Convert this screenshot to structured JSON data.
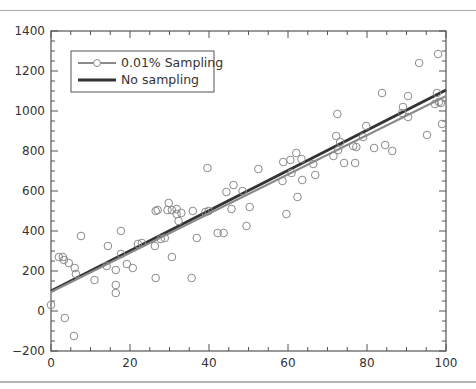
{
  "chart_data": {
    "type": "scatter",
    "title": "",
    "xlabel": "",
    "ylabel": "",
    "xlim": [
      0,
      100
    ],
    "ylim": [
      -200,
      1400
    ],
    "x_ticks": [
      0,
      20,
      40,
      60,
      80,
      100
    ],
    "y_ticks": [
      -200,
      0,
      200,
      400,
      600,
      800,
      1000,
      1200,
      1400
    ],
    "x_tick_labels": [
      "0",
      "20",
      "40",
      "60",
      "80",
      "100"
    ],
    "y_tick_labels": [
      "−200",
      "0",
      "200",
      "400",
      "600",
      "800",
      "1000",
      "1200",
      "1400"
    ],
    "grid": false,
    "legend_position": "upper left",
    "series": [
      {
        "name": "0.01% Sampling",
        "kind": "scatter+fit",
        "color": "#8a8a8a",
        "marker": "open-circle",
        "fit_line": {
          "x": [
            0,
            100
          ],
          "y": [
            95,
            1075
          ]
        },
        "points": [
          [
            0,
            30
          ],
          [
            2,
            270
          ],
          [
            3,
            270
          ],
          [
            3.3,
            255
          ],
          [
            4.5,
            240
          ],
          [
            6,
            215
          ],
          [
            6.3,
            185
          ],
          [
            3.5,
            -35
          ],
          [
            5.8,
            -125
          ],
          [
            7.6,
            375
          ],
          [
            11,
            155
          ],
          [
            14.4,
            325
          ],
          [
            14.1,
            225
          ],
          [
            16.4,
            205
          ],
          [
            16.4,
            130
          ],
          [
            16.4,
            90
          ],
          [
            17.7,
            400
          ],
          [
            17.7,
            285
          ],
          [
            19.2,
            235
          ],
          [
            20.7,
            215
          ],
          [
            22,
            335
          ],
          [
            23,
            340
          ],
          [
            26.3,
            325
          ],
          [
            26.5,
            165
          ],
          [
            26.5,
            500
          ],
          [
            27,
            505
          ],
          [
            27.8,
            360
          ],
          [
            28.8,
            365
          ],
          [
            29.5,
            505
          ],
          [
            29.8,
            540
          ],
          [
            30.6,
            505
          ],
          [
            30.6,
            270
          ],
          [
            31.8,
            510
          ],
          [
            31.8,
            485
          ],
          [
            32.3,
            450
          ],
          [
            33,
            490
          ],
          [
            35.6,
            165
          ],
          [
            35.9,
            500
          ],
          [
            36.9,
            365
          ],
          [
            39.1,
            495
          ],
          [
            39.9,
            500
          ],
          [
            39.6,
            715
          ],
          [
            42.2,
            390
          ],
          [
            43.7,
            390
          ],
          [
            44.4,
            595
          ],
          [
            45.7,
            510
          ],
          [
            46.2,
            630
          ],
          [
            48.5,
            600
          ],
          [
            49.5,
            425
          ],
          [
            50.3,
            520
          ],
          [
            52.5,
            710
          ],
          [
            58.6,
            650
          ],
          [
            58.8,
            745
          ],
          [
            59.6,
            485
          ],
          [
            60.6,
            755
          ],
          [
            60.9,
            690
          ],
          [
            62.1,
            790
          ],
          [
            62.4,
            570
          ],
          [
            63.4,
            760
          ],
          [
            63.6,
            655
          ],
          [
            66.4,
            735
          ],
          [
            66.9,
            680
          ],
          [
            71.5,
            775
          ],
          [
            72.5,
            985
          ],
          [
            72.2,
            875
          ],
          [
            72.7,
            805
          ],
          [
            73.2,
            845
          ],
          [
            74.2,
            740
          ],
          [
            76.5,
            825
          ],
          [
            77,
            740
          ],
          [
            77.3,
            820
          ],
          [
            79,
            870
          ],
          [
            79.8,
            925
          ],
          [
            81.8,
            815
          ],
          [
            83.8,
            1090
          ],
          [
            84.6,
            830
          ],
          [
            86.4,
            800
          ],
          [
            88.9,
            990
          ],
          [
            89.1,
            1020
          ],
          [
            90.4,
            1075
          ],
          [
            90.4,
            970
          ],
          [
            93.2,
            1240
          ],
          [
            95.2,
            880
          ],
          [
            97.2,
            1035
          ],
          [
            97.7,
            1090
          ],
          [
            98,
            1285
          ],
          [
            98.2,
            1045
          ],
          [
            98.7,
            1040
          ],
          [
            99,
            935
          ]
        ]
      },
      {
        "name": "No sampling",
        "kind": "line",
        "color": "#333333",
        "x": [
          0,
          100
        ],
        "y": [
          100,
          1105
        ]
      }
    ]
  },
  "legend": {
    "items": [
      {
        "label": "0.01% Sampling"
      },
      {
        "label": "No sampling"
      }
    ]
  }
}
